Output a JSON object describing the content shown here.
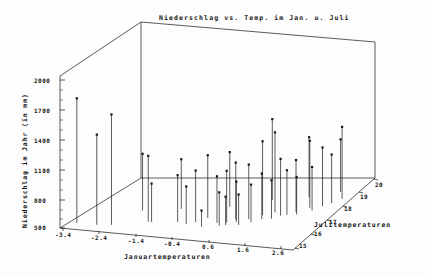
{
  "chart_data": {
    "type": "scatter",
    "title": "Niederschlag vs. Temp. im Jan. u. Juli",
    "xlabel": "Januartemperaturen",
    "ylabel": "Niederschlag im Jahr (in mm)",
    "zlabel": "Julitemperaturen",
    "projection": "3d-stem",
    "grid": false,
    "legend": "none",
    "xlim": [
      -3.9,
      3.1
    ],
    "ylim": [
      500,
      2000
    ],
    "zlim": [
      14.5,
      20.5
    ],
    "xticks": [
      "-3.4",
      "-2.4",
      "-1.4",
      "-0.4",
      "0.6",
      "1.6",
      "2.6"
    ],
    "xtick_values": [
      -3.4,
      -2.4,
      -1.4,
      -0.4,
      0.6,
      1.6,
      2.6
    ],
    "yticks": [
      "2000",
      "1700",
      "1400",
      "1100",
      "800",
      "500"
    ],
    "ytick_values": [
      2000,
      1700,
      1400,
      1100,
      800,
      500
    ],
    "zticks": [
      "15",
      "16",
      "17",
      "18",
      "19",
      "20"
    ],
    "ztick_values": [
      15,
      16,
      17,
      18,
      19,
      20
    ],
    "points": [
      {
        "x": -3.6,
        "y": 1730,
        "z": 15.0
      },
      {
        "x": -3.0,
        "y": 1390,
        "z": 15.0
      },
      {
        "x": -2.6,
        "y": 1590,
        "z": 15.1
      },
      {
        "x": -1.7,
        "y": 1150,
        "z": 15.6
      },
      {
        "x": -1.6,
        "y": 880,
        "z": 15.6
      },
      {
        "x": -0.9,
        "y": 960,
        "z": 15.8
      },
      {
        "x": -0.6,
        "y": 870,
        "z": 15.7
      },
      {
        "x": -0.4,
        "y": 1010,
        "z": 15.9
      },
      {
        "x": -0.2,
        "y": 1120,
        "z": 16.3
      },
      {
        "x": -0.1,
        "y": 660,
        "z": 15.6
      },
      {
        "x": 0.2,
        "y": 960,
        "z": 16.0
      },
      {
        "x": 0.35,
        "y": 830,
        "z": 15.8
      },
      {
        "x": 0.45,
        "y": 1010,
        "z": 16.1
      },
      {
        "x": 0.5,
        "y": 780,
        "z": 15.9
      },
      {
        "x": 0.6,
        "y": 1060,
        "z": 16.4
      },
      {
        "x": 0.7,
        "y": 900,
        "z": 16.2
      },
      {
        "x": 0.85,
        "y": 800,
        "z": 16.0
      },
      {
        "x": 0.95,
        "y": 1040,
        "z": 16.5
      },
      {
        "x": 1.1,
        "y": 870,
        "z": 16.3
      },
      {
        "x": 1.2,
        "y": 1230,
        "z": 16.9
      },
      {
        "x": 1.3,
        "y": 950,
        "z": 16.6
      },
      {
        "x": 1.45,
        "y": 1290,
        "z": 17.2
      },
      {
        "x": 1.55,
        "y": 880,
        "z": 16.7
      },
      {
        "x": 1.7,
        "y": 1060,
        "z": 17.0
      },
      {
        "x": 1.85,
        "y": 940,
        "z": 17.1
      },
      {
        "x": 2.0,
        "y": 1010,
        "z": 17.4
      },
      {
        "x": 2.1,
        "y": 870,
        "z": 17.2
      },
      {
        "x": 2.25,
        "y": 1160,
        "z": 17.8
      },
      {
        "x": 2.4,
        "y": 930,
        "z": 17.6
      },
      {
        "x": 2.55,
        "y": 1080,
        "z": 18.0
      },
      {
        "x": 2.7,
        "y": 980,
        "z": 18.3
      },
      {
        "x": 2.85,
        "y": 1210,
        "z": 18.7
      },
      {
        "x": -2.2,
        "y": 1060,
        "z": 16.4
      },
      {
        "x": -1.2,
        "y": 990,
        "z": 16.8
      },
      {
        "x": 0.05,
        "y": 1040,
        "z": 17.3
      },
      {
        "x": 1.0,
        "y": 1300,
        "z": 18.1
      },
      {
        "x": 1.9,
        "y": 1090,
        "z": 18.6
      },
      {
        "x": 2.6,
        "y": 1020,
        "z": 19.2
      }
    ]
  },
  "axes": {
    "title": "Niederschlag vs. Temp. im Jan. u. Juli",
    "x_title": "Januartemperaturen",
    "y_title": "Niederschlag im Jahr (in mm)",
    "z_title": "Julitemperaturen"
  },
  "ticks": {
    "y": [
      {
        "label": "2000",
        "top": 78
      },
      {
        "label": "1700",
        "top": 108
      },
      {
        "label": "1400",
        "top": 138
      },
      {
        "label": "1100",
        "top": 168
      },
      {
        "label": "800",
        "top": 198
      },
      {
        "label": "500",
        "top": 225
      }
    ],
    "x": [
      {
        "label": "-3.4",
        "left": 55,
        "top": 232
      },
      {
        "label": "-2.4",
        "left": 91,
        "top": 235
      },
      {
        "label": "-1.4",
        "left": 128,
        "top": 238
      },
      {
        "label": "-0.4",
        "left": 164,
        "top": 241
      },
      {
        "label": "0.6",
        "left": 202,
        "top": 244
      },
      {
        "label": "1.6",
        "left": 237,
        "top": 247
      },
      {
        "label": "2.6",
        "left": 272,
        "top": 250
      }
    ],
    "z": [
      {
        "label": "15",
        "left": 299,
        "top": 243
      },
      {
        "label": "16",
        "left": 314,
        "top": 231
      },
      {
        "label": "17",
        "left": 329,
        "top": 219
      },
      {
        "label": "18",
        "left": 344,
        "top": 206
      },
      {
        "label": "19",
        "left": 360,
        "top": 194
      },
      {
        "label": "20",
        "left": 375,
        "top": 182
      }
    ]
  },
  "style": {
    "ink": "#151515",
    "background": "#fdfdfd"
  }
}
